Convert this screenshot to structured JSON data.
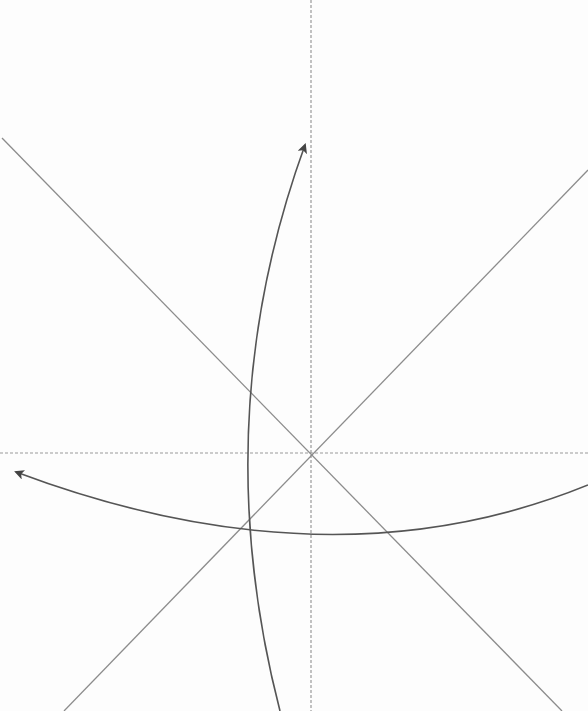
{
  "diagram": {
    "width": 588,
    "height": 711,
    "background": "#fdfdfd",
    "origin": {
      "x": 311,
      "y": 453
    },
    "colors": {
      "axis_dashed": "#9a9a9a",
      "diagonal": "#8c8c8c",
      "curve": "#555555"
    },
    "axes": [
      {
        "name": "vertical-dashed-axis",
        "x1": 311,
        "y1": 0,
        "x2": 311,
        "y2": 711
      },
      {
        "name": "horizontal-dashed-axis",
        "x1": 0,
        "y1": 453,
        "x2": 588,
        "y2": 453
      }
    ],
    "diagonals": [
      {
        "name": "diagonal-line-descending",
        "x1": 2,
        "y1": 138,
        "x2": 562,
        "y2": 711
      },
      {
        "name": "diagonal-line-ascending",
        "x1": 588,
        "y1": 170,
        "x2": 64,
        "y2": 711
      }
    ],
    "curved_arrows": [
      {
        "name": "vertical-curved-arrow",
        "path": "M 280 711 Q 205 420 305 145",
        "direction": "up"
      },
      {
        "name": "horizontal-curved-arrow",
        "path": "M 588 485 Q 330 590 16 472",
        "direction": "left"
      }
    ]
  }
}
